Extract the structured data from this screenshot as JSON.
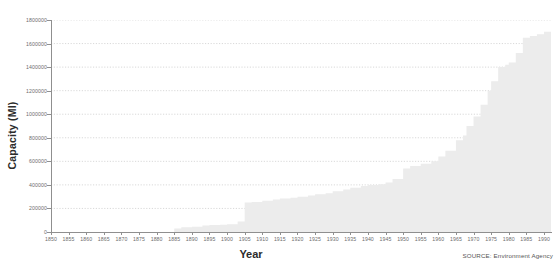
{
  "axes": {
    "y_title": "Capacity (Ml)",
    "x_title": "Year"
  },
  "source": {
    "label": "SOURCE: Environment Agency"
  },
  "style": {
    "area_fill": "#ececec",
    "grid_color": "#c8c8c8",
    "axis_color": "#8f8f8f",
    "tick_text_color": "#6d6d6d",
    "title_color": "#2b2b2b"
  },
  "chart_data": {
    "type": "area",
    "title": "",
    "subtitle": "",
    "xlabel": "Year",
    "ylabel": "Capacity (Ml)",
    "xlim": [
      1850,
      1992
    ],
    "ylim": [
      0,
      1800000
    ],
    "grid": true,
    "legend": false,
    "legend_position": "none",
    "annotations": [
      "SOURCE: Environment Agency"
    ],
    "y_ticks": [
      0,
      200000,
      400000,
      600000,
      800000,
      1000000,
      1200000,
      1400000,
      1600000,
      1800000
    ],
    "y_tick_labels": [
      "0",
      "200000",
      "400000",
      "600000",
      "800000",
      "1000000",
      "1200000",
      "1400000",
      "1600000",
      "1800000"
    ],
    "x_ticks": [
      1850,
      1855,
      1860,
      1865,
      1870,
      1875,
      1880,
      1885,
      1890,
      1895,
      1900,
      1905,
      1910,
      1915,
      1920,
      1925,
      1930,
      1935,
      1940,
      1945,
      1950,
      1955,
      1960,
      1965,
      1970,
      1975,
      1980,
      1985,
      1990
    ],
    "x_tick_labels": [
      "1850",
      "1855",
      "1860",
      "1865",
      "1870",
      "1875",
      "1880",
      "1885",
      "1890",
      "1895",
      "1900",
      "1905",
      "1910",
      "1915",
      "1920",
      "1925",
      "1930",
      "1935",
      "1940",
      "1945",
      "1950",
      "1955",
      "1960",
      "1965",
      "1970",
      "1975",
      "1980",
      "1985",
      "1990"
    ],
    "series": [
      {
        "name": "Cumulative reservoir capacity",
        "x": [
          1850,
          1855,
          1860,
          1865,
          1870,
          1875,
          1880,
          1883,
          1885,
          1887,
          1890,
          1893,
          1895,
          1898,
          1900,
          1903,
          1905,
          1907,
          1910,
          1913,
          1915,
          1918,
          1920,
          1923,
          1925,
          1928,
          1930,
          1933,
          1935,
          1938,
          1940,
          1943,
          1945,
          1947,
          1950,
          1952,
          1955,
          1958,
          1960,
          1962,
          1965,
          1967,
          1968,
          1970,
          1972,
          1974,
          1975,
          1977,
          1979,
          1980,
          1982,
          1984,
          1986,
          1988,
          1990,
          1992
        ],
        "values": [
          0,
          0,
          0,
          0,
          0,
          0,
          0,
          0,
          30000,
          40000,
          45000,
          55000,
          60000,
          62000,
          65000,
          90000,
          250000,
          255000,
          265000,
          275000,
          285000,
          290000,
          300000,
          310000,
          320000,
          330000,
          345000,
          360000,
          375000,
          390000,
          400000,
          405000,
          420000,
          450000,
          540000,
          560000,
          580000,
          600000,
          640000,
          690000,
          780000,
          820000,
          900000,
          980000,
          1080000,
          1200000,
          1280000,
          1400000,
          1420000,
          1440000,
          1520000,
          1650000,
          1665000,
          1680000,
          1700000,
          1760000
        ]
      }
    ]
  }
}
